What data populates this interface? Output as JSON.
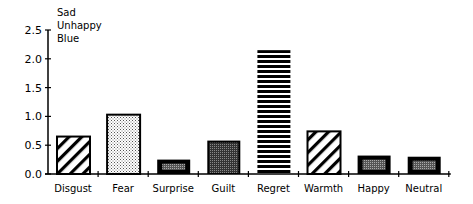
{
  "chart_data": {
    "type": "bar",
    "title_lines": [
      "Sad",
      "Unhappy",
      "Blue"
    ],
    "xlabel": "",
    "ylabel": "",
    "ylim": [
      0,
      2.5
    ],
    "yticks": [
      "0.0",
      "0.5",
      "1.0",
      "1.5",
      "2.0",
      "2.5"
    ],
    "grid": false,
    "legend": "none",
    "categories": [
      "Disgust",
      "Fear",
      "Surprise",
      "Guilt",
      "Regret",
      "Warmth",
      "Happy",
      "Neutral"
    ],
    "values": [
      0.65,
      1.03,
      0.25,
      0.58,
      2.15,
      0.74,
      0.32,
      0.3
    ],
    "patterns": [
      "diagonal-hatch",
      "light-dots",
      "dark-border-gray",
      "dark-gray",
      "horizontal-lines",
      "diagonal-hatch",
      "dark-border-gray",
      "dark-border-gray"
    ]
  }
}
